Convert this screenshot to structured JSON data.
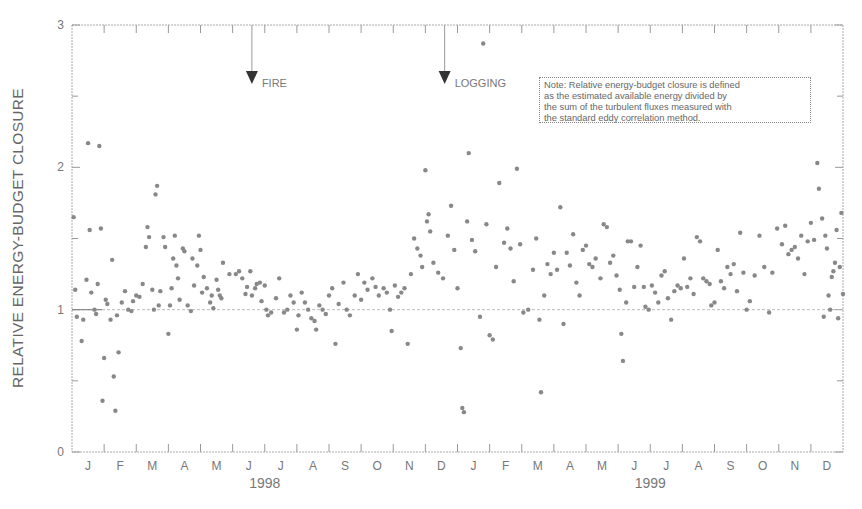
{
  "chart_data": {
    "type": "scatter",
    "title": "",
    "xlabel": "",
    "ylabel": "RELATIVE ENERGY-BUDGET CLOSURE",
    "ylim": [
      0,
      3
    ],
    "yticks": [
      0,
      1,
      2,
      3
    ],
    "xlim_months": [
      0,
      24
    ],
    "month_labels": [
      "J",
      "F",
      "M",
      "A",
      "M",
      "J",
      "J",
      "A",
      "S",
      "O",
      "N",
      "D",
      "J",
      "F",
      "M",
      "A",
      "M",
      "J",
      "J",
      "A",
      "S",
      "O",
      "N",
      "D"
    ],
    "year_labels": [
      {
        "label": "1998",
        "center_month": 6
      },
      {
        "label": "1999",
        "center_month": 18
      }
    ],
    "reference_line": 1.0,
    "grid": false,
    "legend": null,
    "annotations": [
      {
        "label": "FIRE",
        "month": 5.6,
        "arrow_y": 2.6
      },
      {
        "label": "LOGGING",
        "month": 11.6,
        "arrow_y": 2.6
      }
    ],
    "note_lines": [
      "Note: Relative energy-budget closure is defined",
      "as the estimated available energy divided by",
      "the sum of the turbulent fluxes measured with",
      "the standard eddy correlation method."
    ],
    "points": [
      [
        0.05,
        1.65
      ],
      [
        0.1,
        1.14
      ],
      [
        0.15,
        0.95
      ],
      [
        0.3,
        0.78
      ],
      [
        0.35,
        0.93
      ],
      [
        0.45,
        1.21
      ],
      [
        0.5,
        2.17
      ],
      [
        0.55,
        1.56
      ],
      [
        0.6,
        1.12
      ],
      [
        0.7,
        1.0
      ],
      [
        0.75,
        0.97
      ],
      [
        0.8,
        1.18
      ],
      [
        0.85,
        2.15
      ],
      [
        0.9,
        1.57
      ],
      [
        0.95,
        0.36
      ],
      [
        1.0,
        0.66
      ],
      [
        1.05,
        1.07
      ],
      [
        1.1,
        1.04
      ],
      [
        1.2,
        0.93
      ],
      [
        1.25,
        1.35
      ],
      [
        1.3,
        0.53
      ],
      [
        1.35,
        0.29
      ],
      [
        1.4,
        0.96
      ],
      [
        1.45,
        0.7
      ],
      [
        1.55,
        1.05
      ],
      [
        1.65,
        1.13
      ],
      [
        1.75,
        1.0
      ],
      [
        1.85,
        0.99
      ],
      [
        1.9,
        1.06
      ],
      [
        2.0,
        1.1
      ],
      [
        2.1,
        1.09
      ],
      [
        2.2,
        1.18
      ],
      [
        2.3,
        1.44
      ],
      [
        2.35,
        1.58
      ],
      [
        2.4,
        1.51
      ],
      [
        2.5,
        1.14
      ],
      [
        2.55,
        1.0
      ],
      [
        2.6,
        1.81
      ],
      [
        2.65,
        1.87
      ],
      [
        2.7,
        1.03
      ],
      [
        2.75,
        1.13
      ],
      [
        2.85,
        1.51
      ],
      [
        2.9,
        1.44
      ],
      [
        3.0,
        0.83
      ],
      [
        3.05,
        1.03
      ],
      [
        3.1,
        1.15
      ],
      [
        3.15,
        1.36
      ],
      [
        3.2,
        1.52
      ],
      [
        3.25,
        1.31
      ],
      [
        3.3,
        1.22
      ],
      [
        3.35,
        1.07
      ],
      [
        3.45,
        1.43
      ],
      [
        3.5,
        1.41
      ],
      [
        3.6,
        1.03
      ],
      [
        3.7,
        0.99
      ],
      [
        3.75,
        1.36
      ],
      [
        3.8,
        1.17
      ],
      [
        3.9,
        1.31
      ],
      [
        3.95,
        1.52
      ],
      [
        4.0,
        1.42
      ],
      [
        4.05,
        1.12
      ],
      [
        4.1,
        1.23
      ],
      [
        4.2,
        1.15
      ],
      [
        4.3,
        1.05
      ],
      [
        4.35,
        1.1
      ],
      [
        4.4,
        1.01
      ],
      [
        4.5,
        1.21
      ],
      [
        4.55,
        1.14
      ],
      [
        4.6,
        1.1
      ],
      [
        4.65,
        1.08
      ],
      [
        4.7,
        1.33
      ],
      [
        4.9,
        1.25
      ],
      [
        5.1,
        1.25
      ],
      [
        5.2,
        1.27
      ],
      [
        5.3,
        1.22
      ],
      [
        5.4,
        1.11
      ],
      [
        5.45,
        1.16
      ],
      [
        5.55,
        1.27
      ],
      [
        5.6,
        1.1
      ],
      [
        5.7,
        1.15
      ],
      [
        5.75,
        1.18
      ],
      [
        5.85,
        1.19
      ],
      [
        5.9,
        1.06
      ],
      [
        6.0,
        1.17
      ],
      [
        6.05,
        1.0
      ],
      [
        6.1,
        0.96
      ],
      [
        6.2,
        0.98
      ],
      [
        6.35,
        1.08
      ],
      [
        6.45,
        1.22
      ],
      [
        6.6,
        0.98
      ],
      [
        6.7,
        1.0
      ],
      [
        6.8,
        1.1
      ],
      [
        6.9,
        1.05
      ],
      [
        7.0,
        0.86
      ],
      [
        7.05,
        0.96
      ],
      [
        7.15,
        1.12
      ],
      [
        7.25,
        1.05
      ],
      [
        7.35,
        1.0
      ],
      [
        7.45,
        0.94
      ],
      [
        7.55,
        0.92
      ],
      [
        7.6,
        0.86
      ],
      [
        7.7,
        1.03
      ],
      [
        7.8,
        1.0
      ],
      [
        7.9,
        0.97
      ],
      [
        8.0,
        1.1
      ],
      [
        8.1,
        1.15
      ],
      [
        8.2,
        0.76
      ],
      [
        8.3,
        1.04
      ],
      [
        8.45,
        1.19
      ],
      [
        8.55,
        1.0
      ],
      [
        8.65,
        0.96
      ],
      [
        8.8,
        1.1
      ],
      [
        8.9,
        1.25
      ],
      [
        9.0,
        1.07
      ],
      [
        9.1,
        1.19
      ],
      [
        9.2,
        1.14
      ],
      [
        9.35,
        1.22
      ],
      [
        9.45,
        1.16
      ],
      [
        9.55,
        1.1
      ],
      [
        9.7,
        1.15
      ],
      [
        9.8,
        1.12
      ],
      [
        9.9,
        1.0
      ],
      [
        9.95,
        0.85
      ],
      [
        10.05,
        1.17
      ],
      [
        10.15,
        1.09
      ],
      [
        10.25,
        1.12
      ],
      [
        10.35,
        1.15
      ],
      [
        10.45,
        0.76
      ],
      [
        10.55,
        1.25
      ],
      [
        10.65,
        1.5
      ],
      [
        10.75,
        1.43
      ],
      [
        10.85,
        1.38
      ],
      [
        10.9,
        1.3
      ],
      [
        11.0,
        1.98
      ],
      [
        11.05,
        1.62
      ],
      [
        11.1,
        1.67
      ],
      [
        11.15,
        1.55
      ],
      [
        11.25,
        1.33
      ],
      [
        11.4,
        1.26
      ],
      [
        11.55,
        1.22
      ],
      [
        11.7,
        1.52
      ],
      [
        11.8,
        1.73
      ],
      [
        11.9,
        1.42
      ],
      [
        12.0,
        1.15
      ],
      [
        12.1,
        0.73
      ],
      [
        12.15,
        0.31
      ],
      [
        12.2,
        0.28
      ],
      [
        12.3,
        1.62
      ],
      [
        12.35,
        2.1
      ],
      [
        12.45,
        1.49
      ],
      [
        12.55,
        1.41
      ],
      [
        12.7,
        0.95
      ],
      [
        12.8,
        2.87
      ],
      [
        12.9,
        1.6
      ],
      [
        13.0,
        0.82
      ],
      [
        13.1,
        0.79
      ],
      [
        13.2,
        1.3
      ],
      [
        13.3,
        1.89
      ],
      [
        13.45,
        1.47
      ],
      [
        13.55,
        1.57
      ],
      [
        13.65,
        1.43
      ],
      [
        13.75,
        1.2
      ],
      [
        13.85,
        1.99
      ],
      [
        13.95,
        1.46
      ],
      [
        14.05,
        0.98
      ],
      [
        14.2,
        1.0
      ],
      [
        14.35,
        1.28
      ],
      [
        14.45,
        1.5
      ],
      [
        14.55,
        0.93
      ],
      [
        14.6,
        0.42
      ],
      [
        14.7,
        1.1
      ],
      [
        14.8,
        1.32
      ],
      [
        14.9,
        1.25
      ],
      [
        15.0,
        1.4
      ],
      [
        15.1,
        1.28
      ],
      [
        15.2,
        1.72
      ],
      [
        15.3,
        0.9
      ],
      [
        15.4,
        1.4
      ],
      [
        15.5,
        1.31
      ],
      [
        15.6,
        1.53
      ],
      [
        15.7,
        1.19
      ],
      [
        15.8,
        1.1
      ],
      [
        15.9,
        1.42
      ],
      [
        16.0,
        1.45
      ],
      [
        16.1,
        1.32
      ],
      [
        16.2,
        1.3
      ],
      [
        16.3,
        1.36
      ],
      [
        16.45,
        1.22
      ],
      [
        16.55,
        1.6
      ],
      [
        16.65,
        1.58
      ],
      [
        16.75,
        1.33
      ],
      [
        16.85,
        1.38
      ],
      [
        16.95,
        1.24
      ],
      [
        17.05,
        1.14
      ],
      [
        17.1,
        0.83
      ],
      [
        17.15,
        0.64
      ],
      [
        17.25,
        1.05
      ],
      [
        17.3,
        1.48
      ],
      [
        17.4,
        1.48
      ],
      [
        17.5,
        1.16
      ],
      [
        17.6,
        1.3
      ],
      [
        17.7,
        1.45
      ],
      [
        17.8,
        1.16
      ],
      [
        17.85,
        1.02
      ],
      [
        17.95,
        1.0
      ],
      [
        18.05,
        1.17
      ],
      [
        18.15,
        1.12
      ],
      [
        18.25,
        1.05
      ],
      [
        18.35,
        1.24
      ],
      [
        18.45,
        1.27
      ],
      [
        18.55,
        1.08
      ],
      [
        18.65,
        0.93
      ],
      [
        18.75,
        1.13
      ],
      [
        18.85,
        1.17
      ],
      [
        18.95,
        1.15
      ],
      [
        19.05,
        1.36
      ],
      [
        19.15,
        1.16
      ],
      [
        19.25,
        1.22
      ],
      [
        19.35,
        1.11
      ],
      [
        19.45,
        1.51
      ],
      [
        19.55,
        1.48
      ],
      [
        19.65,
        1.22
      ],
      [
        19.75,
        1.2
      ],
      [
        19.85,
        1.18
      ],
      [
        19.9,
        1.03
      ],
      [
        20.0,
        1.05
      ],
      [
        20.1,
        1.42
      ],
      [
        20.2,
        1.2
      ],
      [
        20.3,
        1.15
      ],
      [
        20.4,
        1.3
      ],
      [
        20.5,
        1.25
      ],
      [
        20.6,
        1.32
      ],
      [
        20.7,
        1.13
      ],
      [
        20.8,
        1.54
      ],
      [
        20.9,
        1.26
      ],
      [
        21.0,
        1.0
      ],
      [
        21.1,
        1.06
      ],
      [
        21.25,
        1.24
      ],
      [
        21.4,
        1.52
      ],
      [
        21.55,
        1.3
      ],
      [
        21.7,
        0.98
      ],
      [
        21.8,
        1.26
      ],
      [
        21.95,
        1.57
      ],
      [
        22.1,
        1.46
      ],
      [
        22.2,
        1.59
      ],
      [
        22.3,
        1.39
      ],
      [
        22.4,
        1.42
      ],
      [
        22.5,
        1.44
      ],
      [
        22.6,
        1.36
      ],
      [
        22.7,
        1.52
      ],
      [
        22.8,
        1.25
      ],
      [
        22.9,
        1.48
      ],
      [
        23.0,
        1.61
      ],
      [
        23.1,
        1.49
      ],
      [
        23.2,
        2.03
      ],
      [
        23.25,
        1.85
      ],
      [
        23.35,
        1.64
      ],
      [
        23.45,
        1.52
      ],
      [
        23.55,
        1.1
      ],
      [
        23.6,
        1.0
      ],
      [
        23.7,
        1.27
      ],
      [
        23.8,
        1.56
      ],
      [
        23.9,
        1.3
      ],
      [
        24.0,
        1.11
      ],
      [
        23.65,
        1.23
      ],
      [
        23.75,
        1.33
      ],
      [
        23.95,
        1.68
      ],
      [
        23.5,
        1.43
      ],
      [
        23.85,
        0.94
      ],
      [
        23.4,
        0.95
      ]
    ]
  }
}
